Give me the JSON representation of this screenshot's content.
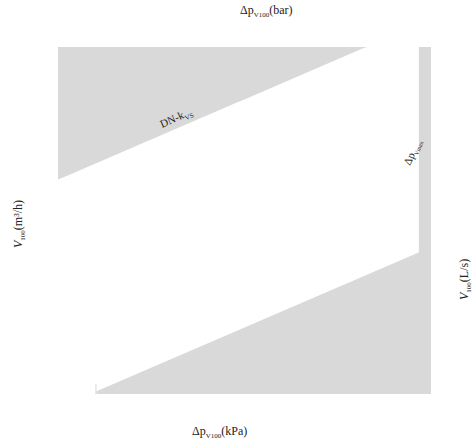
{
  "chart_data": {
    "type": "line",
    "xlabel": "Δp_V100 (kPa)",
    "x2label": "Δp_V100 (bar)",
    "ylabel": "V_100 (m³/h)",
    "y2label": "V_100 (L/s)",
    "xscale": "log",
    "yscale": "log",
    "xlim": [
      1,
      1000
    ],
    "ylim": [
      0.06,
      100
    ],
    "grid": true,
    "x_ticks_kpa": [
      "1",
      "2",
      "3",
      "4",
      "5",
      "6",
      "8",
      "10",
      "20",
      "30",
      "40",
      "50",
      "60",
      "80",
      "100",
      "200",
      "300",
      "400",
      "500",
      "600",
      "800",
      "1000"
    ],
    "x2_ticks_bar": [
      "0.01",
      "0.02",
      "0.03",
      "0.04",
      "0.05",
      "0.06",
      "0.08",
      "0.1",
      "0.2",
      "0.3",
      "0.4",
      "0.5",
      "0.6",
      "0.8",
      "1",
      "2",
      "3",
      "4",
      "5",
      "6",
      "8",
      "10"
    ],
    "y_ticks_m3h": [
      "100",
      "80",
      "60",
      "50",
      "40",
      "30",
      "20",
      "10",
      "8",
      "6",
      "5",
      "4",
      "3",
      "2",
      "1",
      "0.8",
      "0.6",
      "0.5",
      "0.4",
      "0.3",
      "0.2",
      "0.1",
      "0.08",
      "0.06"
    ],
    "y2_ticks_ls": [
      {
        "label": "28",
        "v": 100
      },
      {
        "label": "22.4",
        "v": 80
      },
      {
        "label": "16.8",
        "v": 60
      },
      {
        "label": "14",
        "v": 50
      },
      {
        "label": "11.2",
        "v": 40
      },
      {
        "label": "8.4",
        "v": 30
      },
      {
        "label": "5.8",
        "v": 20
      },
      {
        "label": "2.8",
        "v": 10
      },
      {
        "label": "2.2",
        "v": 8
      },
      {
        "label": "1.7",
        "v": 6
      },
      {
        "label": "1.4",
        "v": 5
      },
      {
        "label": "1.1",
        "v": 4
      },
      {
        "label": "0.85",
        "v": 3
      },
      {
        "label": "0.6",
        "v": 2
      },
      {
        "label": "0.3",
        "v": 1
      },
      {
        "label": "0.2",
        "v": 0.8
      },
      {
        "label": "0.175",
        "v": 0.6
      },
      {
        "label": "0.15",
        "v": 0.5
      },
      {
        "label": "0.11",
        "v": 0.4
      },
      {
        "label": "0.08",
        "v": 0.3
      },
      {
        "label": "0.06",
        "v": 0.2
      },
      {
        "label": "0.03",
        "v": 0.1
      },
      {
        "label": "0.02",
        "v": 0.08
      },
      {
        "label": "0.017",
        "v": 0.06
      }
    ],
    "series_header": "DN-k_VS",
    "max_dp_label": "Δp_Vmax",
    "series": [
      {
        "name": "50-40",
        "kvs": 40
      },
      {
        "name": "40-25",
        "kvs": 25
      },
      {
        "name": "32-16",
        "kvs": 16
      },
      {
        "name": "25-10",
        "kvs": 10
      },
      {
        "name": "20-6.3",
        "kvs": 6.3
      },
      {
        "name": "15-4",
        "kvs": 4
      },
      {
        "name": "15/10-2.5",
        "kvs": 2.5
      },
      {
        "name": "15/6-1.6",
        "kvs": 1.6
      },
      {
        "name": "15/4-1",
        "kvs": 1
      },
      {
        "name": "15/2.5-0.63",
        "kvs": 0.63
      }
    ],
    "formula": "V = kvs * sqrt(Δp_bar)"
  },
  "labels": {
    "top_axis_title": "Δp",
    "top_axis_sub": "V100",
    "top_axis_unit": "(bar)",
    "bottom_axis_title": "Δp",
    "bottom_axis_sub": "V100",
    "bottom_axis_unit": "(kPa)",
    "left_axis_title": "V",
    "left_axis_sub": "100",
    "left_axis_unit": "(m³/h)",
    "right_axis_title": "V",
    "right_axis_sub": "100",
    "right_axis_unit": "(L/s)",
    "dn_header": "DN-k",
    "dn_header_sub": "VS",
    "dpmax": "Δp",
    "dpmax_sub": "Vmax"
  },
  "colors": {
    "shade": "#d9d9d9",
    "grid": "#333333",
    "line": "#111111"
  }
}
